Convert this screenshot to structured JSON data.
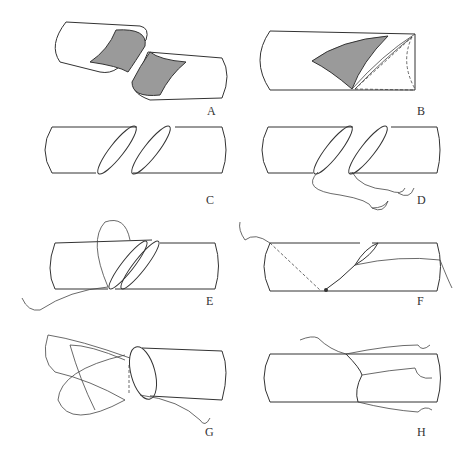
{
  "figure": {
    "panels": [
      {
        "id": "A",
        "label": "A",
        "description": "Two vessel ends cut obliquely with exposed shaded lumen"
      },
      {
        "id": "B",
        "label": "B",
        "description": "Vessel with wedge-shaped shaded cut and dashed cut line"
      },
      {
        "id": "C",
        "label": "C",
        "description": "Two oblique-cut vessel ends aligned"
      },
      {
        "id": "D",
        "label": "D",
        "description": "Stay sutures placed at vessel ends with needles"
      },
      {
        "id": "E",
        "label": "E",
        "description": "Back wall approximated with suture loop"
      },
      {
        "id": "F",
        "label": "F",
        "description": "Continuous suture running along anastomosis (dashed back wall)"
      },
      {
        "id": "G",
        "label": "G",
        "description": "Vessel rotated, sutures looped around"
      },
      {
        "id": "H",
        "label": "H",
        "description": "Completed anastomosis with sutures and needles"
      }
    ]
  },
  "colors": {
    "line": "#333333",
    "shade": "#9a9a9a",
    "background": "#ffffff"
  }
}
